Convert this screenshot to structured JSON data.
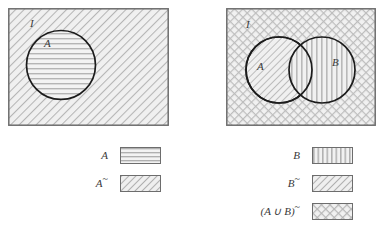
{
  "figure": {
    "type": "venn-diagram-set-complement",
    "universal_set_label": "I",
    "panels": [
      {
        "name": "panel-left",
        "universe_label": "I",
        "universe_fill": "diagonal-hatch",
        "sets": [
          {
            "label": "A",
            "fill": "horizontal-hatch"
          }
        ]
      },
      {
        "name": "panel-right",
        "universe_label": "I",
        "universe_fill": "cross-hatch",
        "sets": [
          {
            "label": "A",
            "fill": "diagonal-hatch"
          },
          {
            "label": "B",
            "fill": "vertical-hatch"
          }
        ]
      }
    ]
  },
  "legend_left": {
    "rows": [
      {
        "label": "A",
        "suffix": "",
        "pattern": "horizontal-hatch"
      },
      {
        "label": "A",
        "suffix": "~",
        "pattern": "diagonal-hatch"
      }
    ]
  },
  "legend_right": {
    "rows": [
      {
        "label": "B",
        "suffix": "",
        "pattern": "vertical-hatch"
      },
      {
        "label": "B",
        "suffix": "~",
        "pattern": "diagonal-hatch"
      },
      {
        "label": "(A ∪ B)",
        "suffix": "~",
        "pattern": "cross-hatch"
      }
    ]
  },
  "labels": {
    "I": "I",
    "A": "A",
    "B": "B",
    "A_complement_base": "A",
    "B_complement_base": "B",
    "tilde": "~",
    "union_open": "(",
    "union_close": ")",
    "union_operator": "∪",
    "union_left": "A",
    "union_right": "B"
  },
  "colors": {
    "stroke_rect": "#6d6d6d",
    "stroke_circle": "#1c1c1c",
    "hatch_line": "#b8b8b8",
    "fill_base": "#f2f2f2",
    "text": "#3a3a3a",
    "background": "#ffffff"
  }
}
